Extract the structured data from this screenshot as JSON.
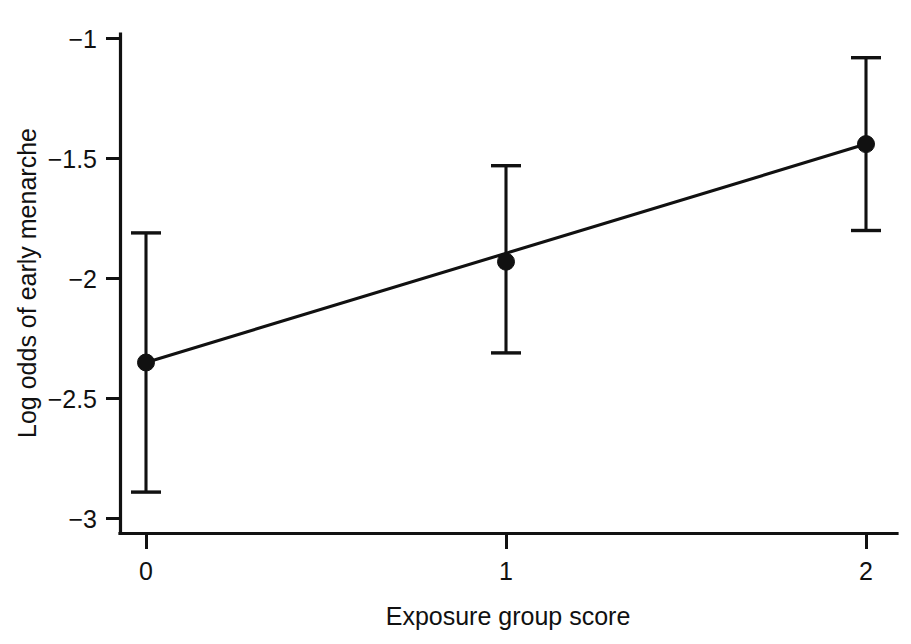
{
  "chart_data": {
    "type": "scatter",
    "title": "",
    "xlabel": "Exposure group score",
    "ylabel": "Log odds of early menarche",
    "x": [
      0,
      1,
      2
    ],
    "xtick_labels": [
      "0",
      "1",
      "2"
    ],
    "ytick_labels": [
      "−1",
      "−1.5",
      "−2",
      "−2.5",
      "−3"
    ],
    "ytick_values": [
      -1,
      -1.5,
      -2,
      -2.5,
      -3
    ],
    "xlim": [
      -0.07,
      2.08
    ],
    "ylim": [
      -3.06,
      -0.96
    ],
    "grid": false,
    "legend": null,
    "series": [
      {
        "name": "Log odds of early menarche",
        "values": [
          -2.35,
          -1.93,
          -1.44
        ],
        "error_low": [
          -2.89,
          -2.31,
          -1.8
        ],
        "error_high": [
          -1.81,
          -1.53,
          -1.08
        ],
        "marker": "filled-circle",
        "line": "fitted-trend-line"
      }
    ],
    "fit_line": {
      "x": [
        0,
        2
      ],
      "y": [
        -2.35,
        -1.44
      ]
    },
    "annotations": []
  },
  "colors": {
    "ink": "#111111",
    "background": "#ffffff"
  }
}
